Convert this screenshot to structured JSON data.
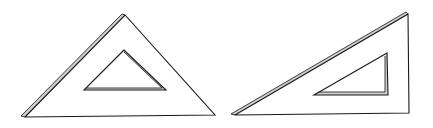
{
  "diagram": {
    "background": "#ffffff",
    "line_color": "#1a1a1a",
    "bevel_color": "#cfcfcf",
    "shapes": [
      {
        "id": "set-square-45",
        "label": "45° set square",
        "outer": [
          [
            125,
            14
          ],
          [
            25,
            117
          ],
          [
            215,
            115
          ]
        ],
        "inner": [
          [
            124,
            50
          ],
          [
            84,
            90
          ],
          [
            166,
            90
          ]
        ]
      },
      {
        "id": "set-square-30-60",
        "label": "30°/60° set square",
        "outer": [
          [
            408,
            13
          ],
          [
            235,
            115
          ],
          [
            409,
            113
          ]
        ],
        "inner": [
          [
            387,
            53
          ],
          [
            314,
            95
          ],
          [
            388,
            95
          ]
        ]
      }
    ]
  }
}
